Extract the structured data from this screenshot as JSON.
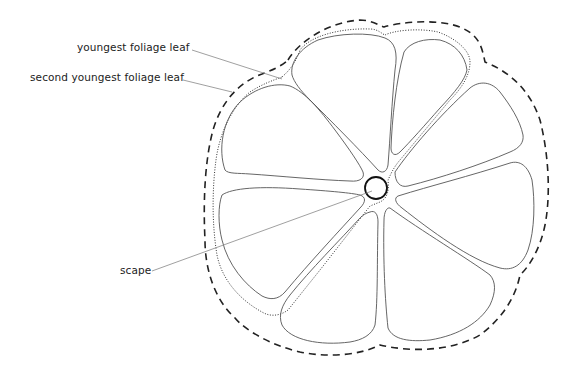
{
  "diagram": {
    "labels": {
      "youngest": "youngest foliage leaf",
      "second_youngest": "second youngest foliage leaf",
      "scape": "scape"
    },
    "legend_styles": {
      "dashed_outline": "outer boundary (dashed)",
      "dotted_outline": "inner boundary (dotted)"
    },
    "colors": {
      "stroke": "#555555",
      "dashed": "#222222",
      "leader": "#888888",
      "background": "#ffffff"
    },
    "leaf_count": 7
  }
}
